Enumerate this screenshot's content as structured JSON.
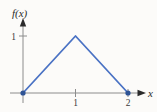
{
  "figure": {
    "background": "#fcfbf9"
  },
  "chart_data": {
    "type": "line",
    "title": "",
    "xlabel": "x",
    "ylabel": "f(x)",
    "points": [
      [
        0,
        0
      ],
      [
        1,
        1
      ],
      [
        2,
        0
      ]
    ],
    "markers": [
      [
        0,
        0
      ],
      [
        2,
        0
      ]
    ],
    "x_ticks": [
      {
        "value": 1,
        "label": "1"
      },
      {
        "value": 2,
        "label": "2"
      }
    ],
    "y_ticks": [
      {
        "value": 1,
        "label": "1"
      }
    ],
    "xlim": [
      0,
      2.3
    ],
    "ylim": [
      0,
      1.25
    ],
    "grid": false,
    "legend": null,
    "line_color": "#4a72c4",
    "marker_color": "#2e5395",
    "axis_color": "#8c8c8c",
    "arrow_color": "#2b2b2b",
    "text_color": "#3a3a3a"
  }
}
